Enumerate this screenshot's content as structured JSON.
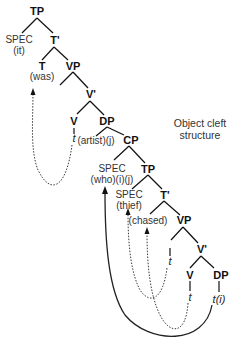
{
  "title": {
    "line1": "Object cleft",
    "line2": "structure"
  },
  "nodes": {
    "tp1": "TP",
    "spec1": "SPEC",
    "spec1_word": "(it)",
    "tbar1": "T'",
    "t1": "T",
    "t1_word": "(was)",
    "vp1": "VP",
    "vbar1": "V'",
    "v1": "V",
    "v1_trace": "t",
    "dp1": "DP",
    "dp1_word": "(artist)(j)",
    "cp": "CP",
    "spec2": "SPEC",
    "spec2_word": "(who)(i)(j)",
    "tp2": "TP",
    "spec3": "SPEC",
    "spec3_word": "(thief)",
    "tbar2": "T'",
    "t2_word": "(chased)",
    "vp2": "VP",
    "vp2_trace": "t",
    "vbar2": "V'",
    "v2": "V",
    "v2_trace": "t",
    "dp2": "DP",
    "dp2_trace": "t(i)"
  },
  "arrows": [
    {
      "name": "v-to-t-movement",
      "style": "dotted",
      "from": "V t",
      "to": "T (was)"
    },
    {
      "name": "subject-movement",
      "style": "dotted",
      "from": "VP t",
      "to": "SPEC (thief)"
    },
    {
      "name": "verb-movement",
      "style": "dotted",
      "from": "V t",
      "to": "(chased)"
    },
    {
      "name": "wh-movement",
      "style": "solid",
      "from": "DP t(i)",
      "to": "SPEC (who)(i)(j)"
    }
  ],
  "colors": {
    "line": "#111111",
    "text": "#222222",
    "background": "#ffffff"
  }
}
